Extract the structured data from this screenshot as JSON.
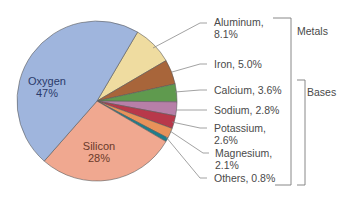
{
  "chart_data": {
    "type": "pie",
    "title": "",
    "start_angle_deg": 59.5,
    "direction": "clockwise",
    "slices": [
      {
        "name": "Aluminum",
        "value": 8.1,
        "label_lines": [
          "Aluminum,",
          "8.1%"
        ],
        "color": "#efdca0"
      },
      {
        "name": "Iron",
        "value": 5.0,
        "label_lines": [
          "Iron, 5.0%"
        ],
        "color": "#a8653a"
      },
      {
        "name": "Calcium",
        "value": 3.6,
        "label_lines": [
          "Calcium, 3.6%"
        ],
        "color": "#5f9a4e"
      },
      {
        "name": "Sodium",
        "value": 2.8,
        "label_lines": [
          "Sodium, 2.8%"
        ],
        "color": "#b77fa8"
      },
      {
        "name": "Potassium",
        "value": 2.6,
        "label_lines": [
          "Potassium,",
          "2.6%"
        ],
        "color": "#b8384a"
      },
      {
        "name": "Magnesium",
        "value": 2.1,
        "label_lines": [
          "Magnesium,",
          "2.1%"
        ],
        "color": "#e8925a"
      },
      {
        "name": "Others",
        "value": 0.8,
        "label_lines": [
          "Others, 0.8%"
        ],
        "color": "#1e7e8c"
      },
      {
        "name": "Silicon",
        "value": 28,
        "label_lines": [
          "Silicon",
          "28%"
        ],
        "color": "#f0a890",
        "text_color": "#6a3a2a"
      },
      {
        "name": "Oxygen",
        "value": 47,
        "label_lines": [
          "Oxygen",
          "47%"
        ],
        "color": "#9fb5dd",
        "text_color": "#2a3a6a"
      }
    ],
    "groups": [
      {
        "label": "Metals",
        "members": [
          "Aluminum",
          "Iron",
          "Calcium",
          "Sodium",
          "Potassium",
          "Magnesium",
          "Others"
        ]
      },
      {
        "label": "Bases",
        "members": [
          "Calcium",
          "Sodium",
          "Potassium",
          "Magnesium",
          "Others"
        ]
      }
    ],
    "legend": "none"
  },
  "labels": {
    "oxygen": {
      "name": "Oxygen",
      "pct": "47%"
    },
    "silicon": {
      "name": "Silicon",
      "pct": "28%"
    },
    "aluminum": {
      "l1": "Aluminum,",
      "l2": "8.1%"
    },
    "iron": {
      "l1": "Iron, 5.0%"
    },
    "calcium": {
      "l1": "Calcium, 3.6%"
    },
    "sodium": {
      "l1": "Sodium, 2.8%"
    },
    "potassium": {
      "l1": "Potassium,",
      "l2": "2.6%"
    },
    "magnesium": {
      "l1": "Magnesium,",
      "l2": "2.1%"
    },
    "others": {
      "l1": "Others, 0.8%"
    },
    "groups": {
      "metals": "Metals",
      "bases": "Bases"
    }
  }
}
